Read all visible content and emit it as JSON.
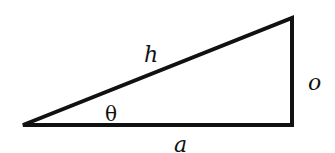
{
  "figure": {
    "stroke_color": "#111111",
    "background": "#ffffff",
    "vertices": {
      "angle_vertex": [
        23,
        125
      ],
      "top_right": [
        292,
        18
      ],
      "right_angle": [
        292,
        125
      ]
    },
    "labels": {
      "hypotenuse": "h",
      "opposite": "o",
      "adjacent": "a",
      "angle": "θ"
    }
  }
}
